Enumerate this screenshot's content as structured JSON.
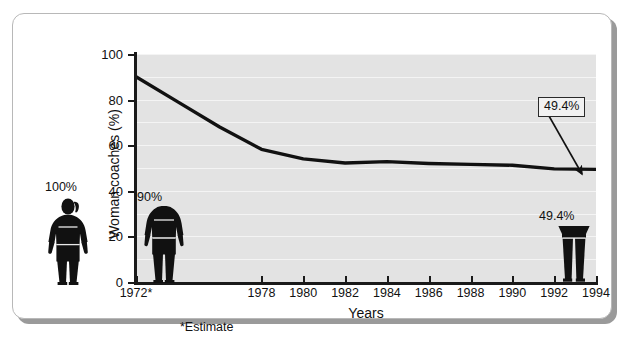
{
  "chart_data": {
    "type": "line",
    "title": "",
    "xlabel": "Years",
    "ylabel": "Woman coaches (%)",
    "ylim": [
      0,
      100
    ],
    "yticks": [
      0,
      20,
      40,
      60,
      80,
      100
    ],
    "ytick_labels": [
      "0",
      "20",
      "40",
      "60",
      "80",
      "100"
    ],
    "xtick_labels": [
      "1972*",
      "1978",
      "1980",
      "1982",
      "1984",
      "1986",
      "1988",
      "1990",
      "1992",
      "1994"
    ],
    "x": [
      1972,
      1974,
      1976,
      1978,
      1980,
      1982,
      1984,
      1986,
      1988,
      1990,
      1992,
      1994
    ],
    "values": [
      90.0,
      79.0,
      68.0,
      58.2,
      54.0,
      52.2,
      52.8,
      52.0,
      51.6,
      51.2,
      49.6,
      49.4
    ],
    "series": [
      {
        "name": "Woman coaches",
        "values": [
          90.0,
          79.0,
          68.0,
          58.2,
          54.0,
          52.2,
          52.8,
          52.0,
          51.6,
          51.2,
          49.6,
          49.4
        ]
      }
    ],
    "grid": true,
    "grid_interval": 10,
    "legend": "none",
    "line_color": "#111111",
    "plot_bg": "#e3e3e3",
    "annotations": [
      {
        "label": "49.4%",
        "type": "callout-box",
        "points_to_x": 1994,
        "points_to_y": 49.4
      }
    ],
    "footnote": "*Estimate"
  },
  "axes": {
    "y_title": "Woman coaches (%)",
    "x_title": "Years",
    "y_ticks": [
      "100",
      "80",
      "60",
      "40",
      "20",
      "0"
    ],
    "x_ticks": [
      "1972*",
      "1978",
      "1980",
      "1982",
      "1984",
      "1986",
      "1988",
      "1990",
      "1992",
      "1994"
    ]
  },
  "callout": {
    "label": "49.4%"
  },
  "figures": [
    {
      "name": "figure-100",
      "label": "100%",
      "fill_fraction": 1.0
    },
    {
      "name": "figure-90",
      "label": "90%",
      "fill_fraction": 0.9
    },
    {
      "name": "figure-49",
      "label": "49.4%",
      "fill_fraction": 0.494
    }
  ],
  "footnote": "*Estimate",
  "colors": {
    "plot_background": "#e3e3e3",
    "gridline": "#f4f4f4",
    "line": "#111111",
    "card_border": "#b8b8b8",
    "shadow": "#9a9a9a"
  }
}
